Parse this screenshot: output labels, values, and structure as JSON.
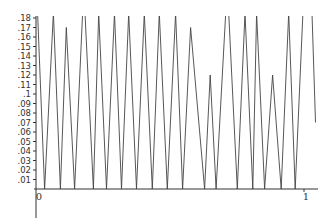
{
  "chart_data": {
    "type": "line",
    "title": "",
    "xlabel": "",
    "ylabel": "",
    "xlim": [
      0,
      1.04
    ],
    "ylim": [
      0,
      0.18
    ],
    "grid": false,
    "legend": null,
    "x_ticks": [
      {
        "value": 0,
        "label": "0"
      },
      {
        "value": 1,
        "label": "1"
      }
    ],
    "y_ticks": [
      {
        "value": 0.01,
        "label": ".01"
      },
      {
        "value": 0.02,
        "label": ".02"
      },
      {
        "value": 0.03,
        "label": ".03"
      },
      {
        "value": 0.04,
        "label": ".04"
      },
      {
        "value": 0.05,
        "label": ".05"
      },
      {
        "value": 0.06,
        "label": ".06"
      },
      {
        "value": 0.07,
        "label": ".07"
      },
      {
        "value": 0.08,
        "label": ".08"
      },
      {
        "value": 0.09,
        "label": ".09"
      },
      {
        "value": 0.1,
        "label": ".1"
      },
      {
        "value": 0.11,
        "label": ".11"
      },
      {
        "value": 0.12,
        "label": ".12"
      },
      {
        "value": 0.13,
        "label": ".13"
      },
      {
        "value": 0.14,
        "label": ".14"
      },
      {
        "value": 0.15,
        "label": ".15"
      },
      {
        "value": 0.16,
        "label": ".16"
      },
      {
        "value": 0.17,
        "label": ".17"
      },
      {
        "value": 0.18,
        "label": ".18"
      }
    ],
    "series": [
      {
        "name": "f(x)",
        "color": "#444444",
        "x": [
          0.006,
          0.032,
          0.065,
          0.091,
          0.113,
          0.144,
          0.174,
          0.183,
          0.214,
          0.234,
          0.263,
          0.293,
          0.319,
          0.346,
          0.375,
          0.404,
          0.434,
          0.46,
          0.49,
          0.521,
          0.547,
          0.577,
          0.629,
          0.65,
          0.672,
          0.708,
          0.719,
          0.751,
          0.78,
          0.809,
          0.823,
          0.853,
          0.883,
          0.915,
          0.943,
          0.967,
          0.996,
          1.03,
          1.043
        ],
        "y": [
          0.185,
          0.0,
          0.185,
          0.0,
          0.17,
          0.0,
          0.185,
          0.185,
          0.0,
          0.185,
          0.0,
          0.185,
          0.0,
          0.185,
          0.0,
          0.185,
          0.0,
          0.185,
          0.0,
          0.185,
          0.0,
          0.17,
          0.0,
          0.12,
          0.0,
          0.185,
          0.185,
          0.0,
          0.185,
          0.0,
          0.185,
          0.0,
          0.12,
          0.0,
          0.185,
          0.0,
          0.185,
          0.185,
          0.07
        ]
      }
    ]
  }
}
